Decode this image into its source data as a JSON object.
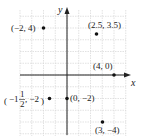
{
  "chart_data": {
    "type": "scatter",
    "title": "",
    "xlabel": "x",
    "ylabel": "y",
    "xlim": [
      -4,
      5
    ],
    "ylim": [
      -5,
      5.5
    ],
    "grid": true,
    "points": [
      {
        "x": -2,
        "y": 4,
        "label": "(−2, 4)"
      },
      {
        "x": 2.5,
        "y": 3.5,
        "label": "(2.5, 3.5)"
      },
      {
        "x": 4,
        "y": 0,
        "label": "(4, 0)"
      },
      {
        "x": -1.5,
        "y": -2,
        "label": "(−1 1/2, −2)"
      },
      {
        "x": 0,
        "y": -2,
        "label": "(0, −2)"
      },
      {
        "x": 3,
        "y": -4,
        "label": "(3, −4)"
      }
    ]
  },
  "labels": {
    "x_axis": "x",
    "y_axis": "y",
    "p1": "(−2, 4)",
    "p2": "(2.5, 3.5)",
    "p3": "(4, 0)",
    "p4_pre": "−1",
    "p4_num": "1",
    "p4_den": "2",
    "p4_post": ", −2",
    "p5": "(0, −2)",
    "p6": "(3, −4)"
  },
  "colors": {
    "grid": "#d0d0d0",
    "axis": "#222222",
    "point": "#111111"
  }
}
